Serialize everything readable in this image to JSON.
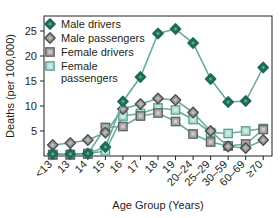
{
  "chart_data": {
    "type": "line",
    "title": "",
    "xlabel": "Age Group (Years)",
    "ylabel": "Deaths (per 100,000)",
    "categories": [
      "<13",
      "13",
      "14",
      "15",
      "16",
      "17",
      "18",
      "19",
      "20–24",
      "25–29",
      "30–59",
      "60–69",
      "≥70"
    ],
    "ylim": [
      0,
      28
    ],
    "yticks": [
      5,
      10,
      15,
      20,
      25
    ],
    "grid": false,
    "legend_position": "top-left",
    "series": [
      {
        "name": "Male drivers",
        "color": "#1b6b58",
        "marker": "diamond",
        "fill": "#1b6b58",
        "values": [
          0.4,
          0.4,
          0.5,
          1.8,
          10.9,
          15.8,
          24.5,
          25.4,
          22.6,
          15.4,
          10.8,
          11.0,
          17.7
        ]
      },
      {
        "name": "Male passengers",
        "color": "#4a4a4a",
        "marker": "diamond",
        "fill": "#9a9a9a",
        "values": [
          2.2,
          2.6,
          3.2,
          4.7,
          9.4,
          10.4,
          11.5,
          11.2,
          8.7,
          5.0,
          1.9,
          1.6,
          3.2
        ]
      },
      {
        "name": "Female drivers",
        "color": "#5f5f5f",
        "marker": "square",
        "fill": "#a8a8a8",
        "values": [
          0.3,
          0.3,
          0.4,
          5.7,
          5.9,
          8.0,
          8.6,
          6.9,
          4.4,
          2.8,
          2.0,
          2.4,
          5.3
        ]
      },
      {
        "name": "Female passengers",
        "color": "#56a392",
        "marker": "square",
        "fill": "#b9ddd4",
        "values": [
          0.2,
          0.2,
          0.5,
          1.0,
          8.0,
          8.5,
          9.6,
          9.2,
          7.3,
          4.7,
          4.5,
          5.0,
          5.5
        ]
      }
    ]
  },
  "legend": {
    "entries": [
      "Male drivers",
      "Male passengers",
      "Female drivers",
      "Female passengers"
    ]
  }
}
